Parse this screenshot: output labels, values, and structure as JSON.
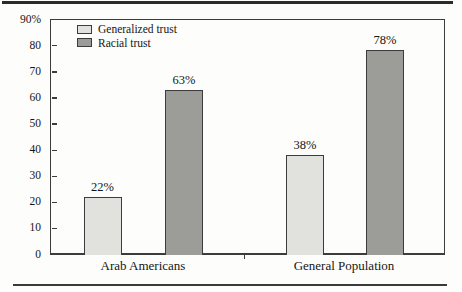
{
  "chart_data": {
    "type": "bar",
    "title": "",
    "categories": [
      "Arab Americans",
      "General Population"
    ],
    "series": [
      {
        "name": "Generalized trust",
        "values": [
          22,
          38
        ],
        "value_labels": [
          "22%",
          "38%"
        ],
        "color": "#e1e1de"
      },
      {
        "name": "Racial trust",
        "values": [
          63,
          78
        ],
        "value_labels": [
          "63%",
          "78%"
        ],
        "color": "#9c9c99"
      }
    ],
    "ylabel": "",
    "xlabel": "",
    "ylim": [
      0,
      90
    ],
    "ytick_step": 10,
    "ytick_labels": [
      "0",
      "10",
      "20",
      "30",
      "40",
      "50",
      "60",
      "70",
      "80",
      "90%"
    ],
    "grid": false,
    "legend_position": "top-left-inside",
    "colors": {
      "axis": "#3c3c3c",
      "bar_border": "#3c3c3c",
      "text": "#161616",
      "background": "#fdfdfb",
      "top_rule": "#2b2b2b",
      "bottom_rule": "#3a3a3a"
    }
  }
}
